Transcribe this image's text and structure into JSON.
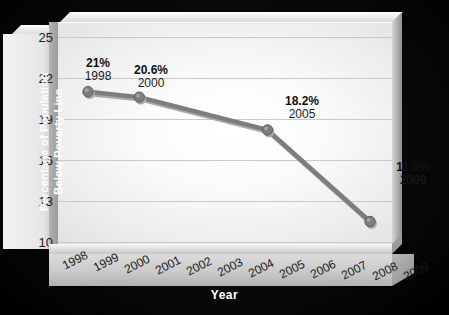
{
  "chart_data": {
    "type": "line",
    "title": "",
    "xlabel": "Year",
    "ylabel": "Percentage of Population Below Poverty Line",
    "ylim": [
      10,
      25
    ],
    "yticks": [
      "25",
      "22",
      "19",
      "16",
      "13",
      "10"
    ],
    "grid": true,
    "legend": "none",
    "x": [
      "1998",
      "1999",
      "2000",
      "2001",
      "2002",
      "2003",
      "2004",
      "2005",
      "2006",
      "2007",
      "2008",
      "2009"
    ],
    "categories": [
      "1998",
      "1999",
      "2000",
      "2001",
      "2002",
      "2003",
      "2004",
      "2005",
      "2006",
      "2007",
      "2008",
      "2009"
    ],
    "series": [
      {
        "name": "Percentage of Population Below Poverty Line",
        "points": [
          {
            "x": "1998",
            "y": 21.0
          },
          {
            "x": "2000",
            "y": 20.6
          },
          {
            "x": "2005",
            "y": 18.2
          },
          {
            "x": "2009",
            "y": 11.5
          }
        ],
        "color": "#7d7d7d"
      }
    ],
    "annotations": [
      {
        "pct": "21%",
        "year": "1998",
        "value": 21.0
      },
      {
        "pct": "20.6%",
        "year": "2000",
        "value": 20.6
      },
      {
        "pct": "18.2%",
        "year": "2005",
        "value": 18.2
      },
      {
        "pct": "11.5%",
        "year": "2009",
        "value": 11.5
      }
    ]
  },
  "axes": {
    "y_title_line1": "Percentage of Population",
    "y_title_line2": "Below Poverty Line",
    "x_title": "Year"
  },
  "yticks": {
    "t0": "25",
    "t1": "22",
    "t2": "19",
    "t3": "16",
    "t4": "13",
    "t5": "10"
  },
  "xticks": {
    "t0": "1998",
    "t1": "1999",
    "t2": "2000",
    "t3": "2001",
    "t4": "2002",
    "t5": "2003",
    "t6": "2004",
    "t7": "2005",
    "t8": "2006",
    "t9": "2007",
    "t10": "2008",
    "t11": "2009"
  },
  "labels": {
    "p1_pct": "21%",
    "p1_year": "1998",
    "p2_pct": "20.6%",
    "p2_year": "2000",
    "p3_pct": "18.2%",
    "p3_year": "2005",
    "p4_pct": "11.5%",
    "p4_year": "2009"
  },
  "colors": {
    "series": "#7d7d7d",
    "series_dark": "#5f5f5f",
    "grid": "#c9c9c9",
    "background": "#000000",
    "panel": "#e9e9e9",
    "text": "#111111",
    "axis_title": "#ffffff"
  }
}
